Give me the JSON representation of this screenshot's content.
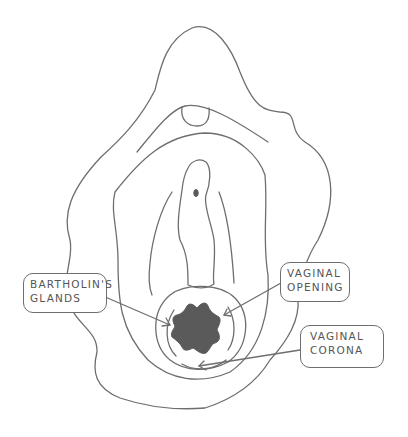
{
  "diagram": {
    "type": "anatomical line drawing",
    "labels": [
      {
        "id": "bartholins-glands",
        "line1": "BARTHOLIN'S",
        "line2": "GLANDS"
      },
      {
        "id": "vaginal-opening",
        "line1": "VAGINAL",
        "line2": "OPENING"
      },
      {
        "id": "vaginal-corona",
        "line1": "VAGINAL",
        "line2": "CORONA"
      }
    ],
    "colors": {
      "stroke": "#6e6e6e",
      "fill": "#5a5a5a",
      "background": "#ffffff"
    }
  }
}
